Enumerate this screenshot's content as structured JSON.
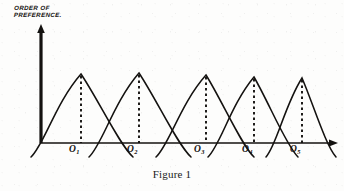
{
  "figure": {
    "caption": "Figure 1",
    "y_axis_label_line1": "ORDER OF",
    "y_axis_label_line2": "PREFERENCE.",
    "ink_color": "#141210",
    "paper_color": "#fdfdfc"
  },
  "axis_tick_labels": [
    {
      "base": "O",
      "sub": "1"
    },
    {
      "base": "O",
      "sub": "2"
    },
    {
      "base": "O",
      "sub": "3"
    },
    {
      "base": "O",
      "sub": "4"
    },
    {
      "base": "O",
      "sub": "5"
    }
  ],
  "chart_data": {
    "type": "line",
    "title": "Figure 1",
    "subtitle": "",
    "xlabel": "",
    "ylabel": "ORDER OF PREFERENCE.",
    "grid": false,
    "legend": null,
    "legend_position": "none",
    "annotations": [
      "Five overlapping single-peaked (bell-shaped) preference curves drawn over a common horizontal axis.",
      "A dashed vertical line drops from each curve's peak to its ideal point on the axis.",
      "Each curve descends below the baseline on both flanks.",
      "Vertical axis is an arrow labelled ORDER OF PREFERENCE.; horizontal axis is an arrow with no numeric scale."
    ],
    "xlim": [
      0,
      344
    ],
    "ylim": [
      0,
      143
    ],
    "axis_baseline_y": 143,
    "y_axis_x": 41,
    "x_axis_arrow_x": 336,
    "y_axis_arrow_y": 28,
    "categories": [
      "O1",
      "O2",
      "O3",
      "O4",
      "O5"
    ],
    "series": [
      {
        "name": "Curve 1",
        "peak_label": "O1",
        "peak_x": 81,
        "peak_y": 74,
        "peak_height": 69,
        "left_foot_x": 37,
        "right_foot_x": 127
      },
      {
        "name": "Curve 2",
        "peak_label": "O2",
        "peak_x": 139,
        "peak_y": 73,
        "peak_height": 70,
        "left_foot_x": 95,
        "right_foot_x": 185
      },
      {
        "name": "Curve 3",
        "peak_label": "O3",
        "peak_x": 206,
        "peak_y": 75,
        "peak_height": 68,
        "left_foot_x": 162,
        "right_foot_x": 248
      },
      {
        "name": "Curve 4",
        "peak_label": "O4",
        "peak_x": 254,
        "peak_y": 77,
        "peak_height": 66,
        "left_foot_x": 214,
        "right_foot_x": 292
      },
      {
        "name": "Curve 5",
        "peak_label": "O5",
        "peak_x": 302,
        "peak_y": 78,
        "peak_height": 65,
        "left_foot_x": 272,
        "right_foot_x": 330
      }
    ],
    "tick_positions": [
      81,
      139,
      206,
      254,
      302
    ]
  }
}
